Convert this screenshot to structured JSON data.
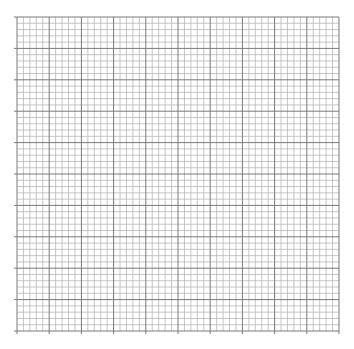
{
  "grid": {
    "left": 17,
    "top": 17,
    "width": 322,
    "height": 314,
    "major_cols": 10,
    "major_rows": 10,
    "minor_per_major": 5,
    "minor_color": "#b8b8b8",
    "major_color": "#7a7a7a",
    "background": "#ffffff"
  }
}
